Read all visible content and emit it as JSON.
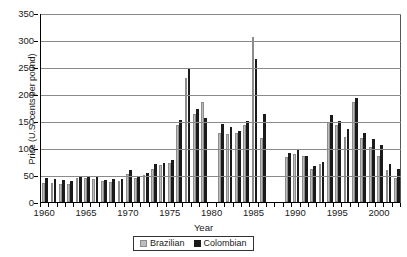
{
  "chart_data": {
    "type": "bar",
    "title": "",
    "xlabel": "Year",
    "ylabel": "Price (U.S. cents per pound)",
    "ylim": [
      0,
      350
    ],
    "ytick_step": 50,
    "yticks": [
      "350",
      "300",
      "250",
      "200",
      "150",
      "100",
      "50",
      "0"
    ],
    "grid": "horizontal",
    "legend_position": "bottom-center",
    "categories": [
      "1960",
      "1961",
      "1962",
      "1963",
      "1964",
      "1965",
      "1966",
      "1967",
      "1968",
      "1969",
      "1970",
      "1971",
      "1972",
      "1973",
      "1974",
      "1975",
      "1976",
      "1977",
      "1978",
      "1979",
      "1980",
      "1981",
      "1982",
      "1983",
      "1984",
      "1985",
      "1986",
      "1987",
      "1988",
      "1989",
      "1990",
      "1991",
      "1992",
      "1993",
      "1994",
      "1995",
      "1996",
      "1997",
      "1998",
      "1999",
      "2000",
      "2001",
      "2002"
    ],
    "xtick_labels": [
      "1960",
      "1965",
      "1970",
      "1975",
      "1980",
      "1985",
      "1990",
      "1995",
      "2000"
    ],
    "series": [
      {
        "name": "Brazilian",
        "color": "#bdbdbd",
        "values": [
          36,
          36,
          34,
          34,
          44,
          44,
          42,
          39,
          37,
          38,
          52,
          44,
          50,
          61,
          68,
          73,
          142,
          230,
          163,
          185,
          null,
          128,
          126,
          128,
          143,
          305,
          118,
          null,
          null,
          84,
          89,
          85,
          62,
          70,
          148,
          143,
          120,
          186,
          118,
          101,
          86,
          60,
          45
        ]
      },
      {
        "name": "Colombian",
        "color": "#1a1a1a",
        "values": [
          45,
          43,
          41,
          39,
          47,
          48,
          47,
          41,
          42,
          43,
          60,
          49,
          54,
          70,
          73,
          78,
          151,
          247,
          172,
          155,
          null,
          145,
          139,
          132,
          150,
          265,
          163,
          null,
          null,
          90,
          96,
          85,
          66,
          74,
          162,
          150,
          135,
          192,
          128,
          116,
          105,
          70,
          62
        ]
      }
    ]
  },
  "legend": {
    "items": [
      {
        "label": "Brazilian",
        "swatch": "br"
      },
      {
        "label": "Colombian",
        "swatch": "co"
      }
    ]
  }
}
